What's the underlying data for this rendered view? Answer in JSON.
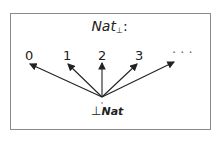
{
  "diagram": {
    "title_name": "Nat",
    "title_sub": "⊥",
    "title_suffix": ":",
    "nodes": [
      {
        "label": "0"
      },
      {
        "label": "1"
      },
      {
        "label": "2"
      },
      {
        "label": "3"
      },
      {
        "label": "· · ·"
      }
    ],
    "bottom_symbol": "⊥",
    "bottom_name": "Nat"
  }
}
